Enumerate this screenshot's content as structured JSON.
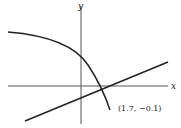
{
  "diagram": {
    "axes": {
      "x_label": "x",
      "y_label": "y"
    },
    "curve": {
      "description": "decreasing concave-down curve crossing the line"
    },
    "line": {
      "description": "increasing straight line"
    },
    "intersection_label": "(1.7, −0.1)",
    "colors": {
      "stroke": "#222222",
      "axis": "#555555",
      "background": "#ffffff"
    }
  }
}
